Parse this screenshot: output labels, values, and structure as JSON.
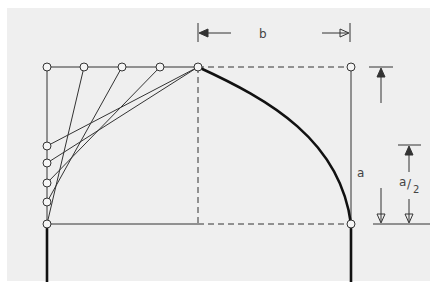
{
  "diagram": {
    "colors": {
      "background": "#efefef",
      "line": "#222222",
      "page": "#ffffff"
    },
    "labels": {
      "width": "b",
      "height": "a",
      "half_height_num": "a",
      "half_height_sep": "/",
      "half_height_den": "2"
    },
    "top_points_count": 5,
    "side_points_count": 5
  }
}
